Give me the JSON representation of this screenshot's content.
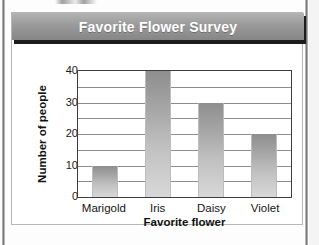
{
  "card": {
    "title": "Favorite Flower Survey"
  },
  "chart_data": {
    "type": "bar",
    "title": "Favorite Flower Survey",
    "categories": [
      "Marigold",
      "Iris",
      "Daisy",
      "Violet"
    ],
    "values": [
      10,
      40,
      30,
      20
    ],
    "xlabel": "Favorite flower",
    "ylabel": "Number of people",
    "ylim": [
      0,
      40
    ],
    "ytick_labels": [
      "0",
      "10",
      "20",
      "30",
      "40"
    ],
    "ytick_values": [
      0,
      10,
      20,
      30,
      40
    ],
    "gridline_values": [
      0,
      5,
      10,
      15,
      20,
      25,
      30,
      35,
      40
    ],
    "grid": true,
    "legend": null,
    "colors": {
      "bar_top": "#8e8e8e",
      "bar_bottom": "#d8d8d8",
      "frame": "#3d3d3d",
      "gridline": "#8c8c8c",
      "title_bar_top": "#b3b3b3",
      "title_bar_bottom": "#868686",
      "title_text": "#ffffff",
      "axis_text": "#151515",
      "card_background": "#ffffff"
    }
  }
}
